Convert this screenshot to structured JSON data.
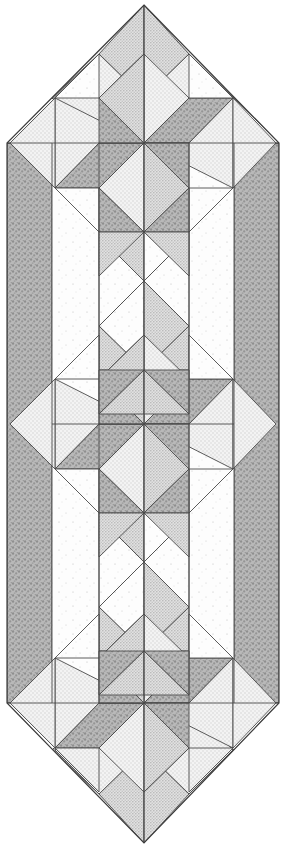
{
  "document": {
    "title": "Quilt Table Runner Layout Diagram",
    "kind": "quilt-block-diagram",
    "canvas": {
      "width": 286,
      "height": 848,
      "background": "#ffffff"
    }
  },
  "palette": {
    "background_white": "#ffffff",
    "fabric_light": "#f2f2f2",
    "fabric_light_speckle": "#e8e8e8",
    "fabric_medium": "#d0d0d0",
    "fabric_medium_dark": "#b4b4b4",
    "fabric_dark": "#9a9a9a",
    "fabric_darkest": "#8c8c8c",
    "seam_line": "#4a4a4a",
    "outline": "#3d3d3d"
  },
  "fabrics": [
    {
      "id": "white",
      "label": "Background White",
      "color": "#fcfcfc",
      "texture": "sparse-dots"
    },
    {
      "id": "light",
      "label": "Light Print",
      "color": "#f0f0f0",
      "texture": "fine-dots"
    },
    {
      "id": "medium",
      "label": "Medium Print",
      "color": "#d6d6d6",
      "texture": "dense-dots"
    },
    {
      "id": "dark",
      "label": "Dark Print",
      "color": "#a8a8a8",
      "texture": "mottled"
    },
    {
      "id": "darkest",
      "label": "Darkest Print",
      "color": "#989898",
      "texture": "mottled"
    }
  ],
  "geometry": {
    "apex_top": {
      "x": 144,
      "y": 5
    },
    "apex_bottom": {
      "x": 144,
      "y": 843
    },
    "left_x": 7,
    "right_x": 279,
    "shoulder_top_y": 143,
    "shoulder_bottom_y": 703,
    "border_width": 45,
    "star_half": 89,
    "star_centers_y": [
      143,
      424,
      703
    ],
    "star_center_x": 144,
    "mini_star_centers_y": [
      281,
      562
    ],
    "mini_star_half": 45
  },
  "legend": {
    "shape": "elongated hexagon table runner",
    "block_count": 3,
    "block_name": "LeMoyne Star",
    "sashing": "mini four-point star"
  }
}
